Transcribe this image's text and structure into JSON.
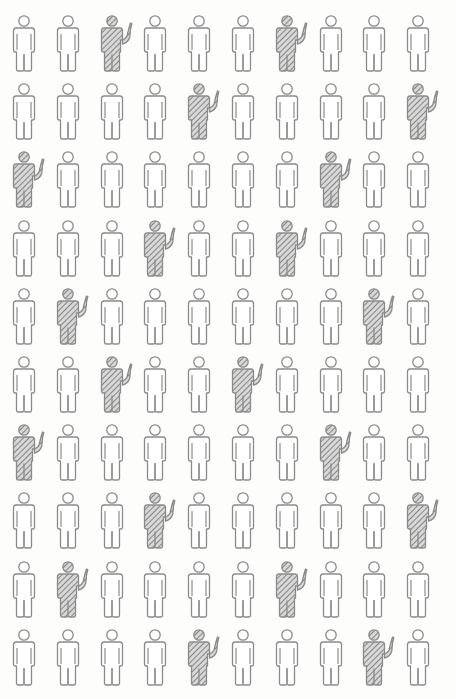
{
  "chart_data": {
    "type": "pictogram",
    "title": "",
    "rows": 10,
    "cols": 10,
    "total": 100,
    "highlighted_count": 20,
    "highlighted_percent": 20,
    "legend": [],
    "icon": "person-icon",
    "highlight_style": "hatched person raising hand",
    "plain_style": "outlined person",
    "highlighted_positions": [
      [
        1,
        3
      ],
      [
        1,
        7
      ],
      [
        2,
        5
      ],
      [
        2,
        10
      ],
      [
        3,
        1
      ],
      [
        3,
        8
      ],
      [
        4,
        4
      ],
      [
        4,
        7
      ],
      [
        5,
        2
      ],
      [
        5,
        9
      ],
      [
        6,
        3
      ],
      [
        6,
        6
      ],
      [
        7,
        1
      ],
      [
        7,
        8
      ],
      [
        8,
        4
      ],
      [
        8,
        10
      ],
      [
        9,
        2
      ],
      [
        9,
        7
      ],
      [
        10,
        5
      ],
      [
        10,
        9
      ]
    ]
  },
  "colors": {
    "outline": "#8a8a8a",
    "hatch": "#7a7a7a",
    "hatch_bg": "#d4d4d4",
    "background": "#fdfdfc"
  }
}
